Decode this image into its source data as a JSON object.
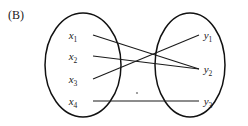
{
  "panel": {
    "label": "(B)"
  },
  "figure": {
    "type": "bipartite-graph",
    "background_color": "#ffffff",
    "stroke_color": "#1a1a1a"
  },
  "left_set": {
    "name": "domain-set",
    "shape": "ellipse",
    "nodes": [
      {
        "id": "x1",
        "label": "x",
        "subscript": "1"
      },
      {
        "id": "x2",
        "label": "x",
        "subscript": "2"
      },
      {
        "id": "x3",
        "label": "x",
        "subscript": "3"
      },
      {
        "id": "x4",
        "label": "x",
        "subscript": "4"
      }
    ]
  },
  "right_set": {
    "name": "codomain-set",
    "shape": "ellipse",
    "nodes": [
      {
        "id": "y1",
        "label": "y",
        "subscript": "1"
      },
      {
        "id": "y2",
        "label": "y",
        "subscript": "2"
      },
      {
        "id": "y3",
        "label": "y",
        "subscript": "3"
      }
    ]
  },
  "edges": [
    {
      "from": "x1",
      "to": "y2"
    },
    {
      "from": "x2",
      "to": "y2"
    },
    {
      "from": "x3",
      "to": "y1"
    },
    {
      "from": "x4",
      "to": "y3"
    }
  ]
}
